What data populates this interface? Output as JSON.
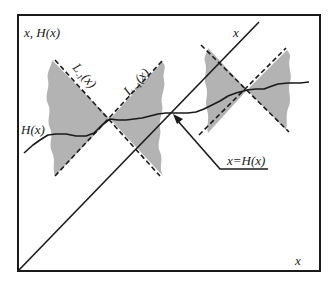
{
  "diagram": {
    "frame": {
      "x": 18,
      "y": 15,
      "width": 302,
      "height": 256
    },
    "colors": {
      "stroke": "#1a1a1a",
      "shade": "#b3b3b3",
      "background": "#ffffff"
    },
    "labels": {
      "y_axis": "x, H(x)",
      "x_axis": "x",
      "diagonal": "x",
      "curve": "H(x)",
      "cone_minus": "L",
      "cone_minus_sub": "-1",
      "cone_minus_arg": "(x)",
      "cone_plus": "L",
      "cone_plus_sub": "+1",
      "cone_plus_arg": "(x)",
      "fixed_point": "x=H(x)"
    },
    "elements": {
      "diagonal_line": "identity line x",
      "curve": "function H(x)",
      "cones": [
        {
          "name": "left-cone",
          "apex": [
            110,
            119
          ],
          "description": "Lipschitz cone bounds L-1(x) and L+1(x)"
        },
        {
          "name": "right-cone",
          "apex": [
            247,
            90
          ],
          "description": "Lipschitz cone bounds"
        }
      ],
      "fixed_point": [
        173,
        113
      ]
    }
  }
}
